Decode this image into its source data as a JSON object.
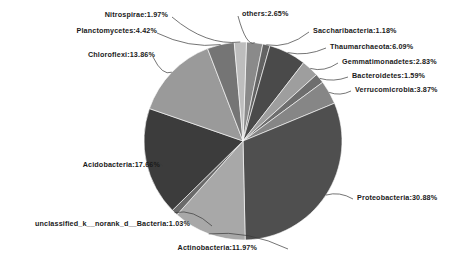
{
  "chart_data": {
    "type": "pie",
    "title": "",
    "xlabel": "",
    "ylabel": "",
    "legend_position": "none",
    "grid": false,
    "value_unit": "percent",
    "label_format": "name:value%",
    "categories": [
      "others",
      "Saccharibacteria",
      "Thaumarchaeota",
      "Gemmatimonadetes",
      "Bacteroidetes",
      "Verrucomicrobia",
      "Proteobacteria",
      "Actinobacteria",
      "unclassified_k__norank_d__Bacteria",
      "Acidobacteria",
      "Chloroflexi",
      "Planctomycetes",
      "Nitrospirae"
    ],
    "values": [
      2.65,
      1.18,
      6.09,
      2.83,
      1.59,
      3.87,
      30.88,
      11.97,
      1.03,
      17.66,
      13.86,
      4.42,
      1.97
    ],
    "colors": [
      "#8a8a8a",
      "#636363",
      "#4a4a4a",
      "#9e9e9e",
      "#6e6e6e",
      "#868686",
      "#4f4f4f",
      "#a8a8a8",
      "#6a6a6a",
      "#3c3c3c",
      "#9a9a9a",
      "#757575",
      "#bdbdbd"
    ],
    "slices": [
      {
        "name": "others",
        "value": 2.65,
        "label": "others:2.65%"
      },
      {
        "name": "Saccharibacteria",
        "value": 1.18,
        "label": "Saccharibacteria:1.18%"
      },
      {
        "name": "Thaumarchaeota",
        "value": 6.09,
        "label": "Thaumarchaeota:6.09%"
      },
      {
        "name": "Gemmatimonadetes",
        "value": 2.83,
        "label": "Gemmatimonadetes:2.83%"
      },
      {
        "name": "Bacteroidetes",
        "value": 1.59,
        "label": "Bacteroidetes:1.59%"
      },
      {
        "name": "Verrucomicrobia",
        "value": 3.87,
        "label": "Verrucomicrobia:3.87%"
      },
      {
        "name": "Proteobacteria",
        "value": 30.88,
        "label": "Proteobacteria:30.88%"
      },
      {
        "name": "Actinobacteria",
        "value": 11.97,
        "label": "Actinobacteria:11.97%"
      },
      {
        "name": "unclassified_k__norank_d__Bacteria",
        "value": 1.03,
        "label": "unclassified_k__norank_d__Bacteria:1.03%"
      },
      {
        "name": "Acidobacteria",
        "value": 17.66,
        "label": "Acidobacteria:17.66%"
      },
      {
        "name": "Chloroflexi",
        "value": 13.86,
        "label": "Chloroflexi:13.86%"
      },
      {
        "name": "Planctomycetes",
        "value": 4.42,
        "label": "Planctomycetes:4.42%"
      },
      {
        "name": "Nitrospirae",
        "value": 1.97,
        "label": "Nitrospirae:1.97%"
      }
    ],
    "total": 100.0
  }
}
